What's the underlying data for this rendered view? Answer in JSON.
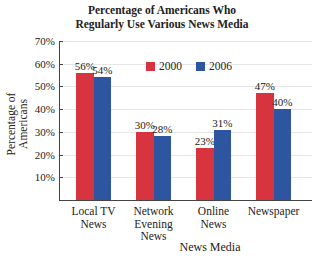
{
  "chart_data": {
    "type": "bar",
    "title_lines": [
      "Percentage of Americans Who",
      "Regularly Use Various News Media"
    ],
    "xlabel": "News Media",
    "ylabel": "Percentage of Americans",
    "categories": [
      "Local TV News",
      "Network Evening News",
      "Online News",
      "Newspaper"
    ],
    "category_lines": [
      [
        "Local TV",
        "News"
      ],
      [
        "Network",
        "Evening",
        "News"
      ],
      [
        "Online",
        "News"
      ],
      [
        "Newspaper"
      ]
    ],
    "series": [
      {
        "name": "2000",
        "color": "#d8343f",
        "values": [
          56,
          30,
          23,
          47
        ],
        "labels": [
          "56%",
          "30%",
          "23%",
          "47%"
        ]
      },
      {
        "name": "2006",
        "color": "#2e55a0",
        "values": [
          54,
          28,
          31,
          40
        ],
        "labels": [
          "54%",
          "28%",
          "31%",
          "40%"
        ]
      }
    ],
    "ylim": [
      0,
      70
    ],
    "yticks": [
      "10%",
      "20%",
      "30%",
      "40%",
      "50%",
      "60%",
      "70%"
    ],
    "grid": true,
    "legend_position": "top-center"
  }
}
